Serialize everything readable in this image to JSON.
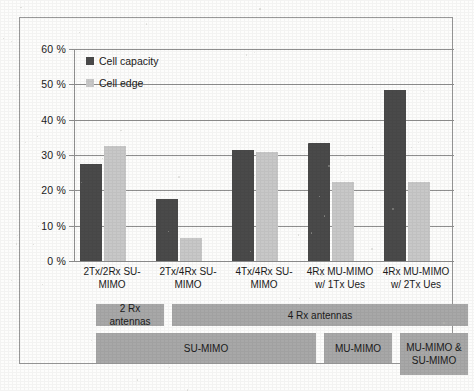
{
  "chart_data": {
    "type": "bar",
    "title": "",
    "xlabel": "",
    "ylabel": "",
    "ylim": [
      0,
      60
    ],
    "ytick_step": 10,
    "ytick_labels": [
      "0 %",
      "10 %",
      "20 %",
      "30 %",
      "40 %",
      "50 %",
      "60 %"
    ],
    "grid": true,
    "legend_position": "top-left",
    "categories": [
      "2Tx/2Rx SU-MIMO",
      "2Tx/4Rx SU-MIMO",
      "4Tx/4Rx SU-MIMO",
      "4Rx  MU-MIMO w/ 1Tx Ues",
      "4Rx MU-MIMO w/ 2Tx Ues"
    ],
    "category_lines": [
      [
        "2Tx/2Rx SU-",
        "MIMO"
      ],
      [
        "2Tx/4Rx SU-",
        "MIMO"
      ],
      [
        "4Tx/4Rx SU-",
        "MIMO"
      ],
      [
        "4Rx  MU-MIMO",
        "w/ 1Tx Ues"
      ],
      [
        "4Rx MU-MIMO",
        "w/ 2Tx Ues"
      ]
    ],
    "series": [
      {
        "name": "Cell capacity",
        "color": "#4a4a4a",
        "values": [
          27.5,
          17.5,
          31.5,
          33.5,
          48.5
        ]
      },
      {
        "name": "Cell edge",
        "color": "#c8c8c8",
        "values": [
          32.5,
          6.5,
          30.8,
          22.5,
          22.5
        ]
      }
    ]
  },
  "legend": {
    "items": [
      {
        "label": "Cell capacity",
        "color": "#4a4a4a"
      },
      {
        "label": "Cell edge",
        "color": "#c8c8c8"
      }
    ]
  },
  "banners": {
    "color": "#a8a8a8",
    "row1": [
      {
        "label": "2 Rx antennas",
        "start": 0,
        "span": 1
      },
      {
        "label": "4 Rx antennas",
        "start": 1,
        "span": 4
      }
    ],
    "row2": [
      {
        "label": "SU-MIMO",
        "start": 0,
        "span": 3,
        "lines": [
          "SU-MIMO"
        ]
      },
      {
        "label": "MU-MIMO",
        "start": 3,
        "span": 1,
        "lines": [
          "MU-MIMO"
        ]
      },
      {
        "label": "MU-MIMO & SU-MIMO",
        "start": 4,
        "span": 1,
        "lines": [
          "MU-MIMO &",
          "SU-MIMO"
        ]
      }
    ]
  }
}
